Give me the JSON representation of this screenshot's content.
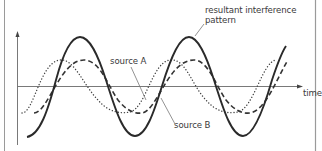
{
  "diagram": {
    "title": "",
    "labels": {
      "resultant": "resultant interference pattern",
      "source_a": "source A",
      "source_b": "source B",
      "x_axis": "time"
    },
    "colors": {
      "border": "#9a9a9a",
      "axis": "#6a6a6a",
      "resultant": "#2a2a2a",
      "source_a": "#3a3a3a",
      "source_b": "#555555",
      "leader": "#777777",
      "text": "#3a3a3a"
    },
    "curves": [
      {
        "name": "resultant interference pattern",
        "style": "solid",
        "relative_amplitude": 1.0
      },
      {
        "name": "source A",
        "style": "dashed",
        "relative_amplitude": 0.6
      },
      {
        "name": "source B",
        "style": "dotted",
        "relative_amplitude": 0.6
      }
    ]
  }
}
